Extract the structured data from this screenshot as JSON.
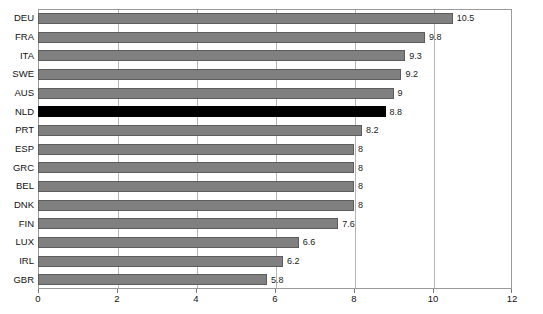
{
  "chart_data": {
    "type": "bar",
    "orientation": "horizontal",
    "title": "",
    "subtitle": "",
    "xlabel": "",
    "ylabel": "",
    "xlim": [
      0,
      12
    ],
    "ylim": null,
    "grid": true,
    "grid_axis": "x",
    "legend": null,
    "legend_position": "none",
    "xticks": [
      0,
      2,
      4,
      6,
      8,
      10,
      12
    ],
    "xtick_labels": [
      "0",
      "2",
      "4",
      "6",
      "8",
      "10",
      "12"
    ],
    "categories": [
      "DEU",
      "FRA",
      "ITA",
      "SWE",
      "AUS",
      "NLD",
      "PRT",
      "ESP",
      "GRC",
      "BEL",
      "DNK",
      "FIN",
      "LUX",
      "IRL",
      "GBR"
    ],
    "values": [
      10.5,
      9.8,
      9.3,
      9.2,
      9,
      8.8,
      8.2,
      8,
      8,
      8,
      8,
      7.6,
      6.6,
      6.2,
      5.8
    ],
    "value_labels": [
      "10.5",
      "9.8",
      "9.3",
      "9.2",
      "9",
      "8.8",
      "8.2",
      "8",
      "8",
      "8",
      "8",
      "7.6",
      "6.6",
      "6.2",
      "5.8"
    ],
    "highlight_category": "NLD",
    "highlight_index": 5,
    "colors": {
      "bar": "#808080",
      "bar_border": "#5c5c5c",
      "bar_highlight": "#000000",
      "gridline": "#b4b4b4",
      "axis": "#9a9a9a",
      "text": "#111111",
      "background": "#ffffff"
    }
  }
}
